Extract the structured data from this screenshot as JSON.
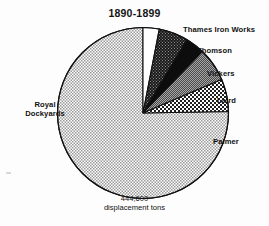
{
  "chart_data": {
    "type": "pie",
    "title": "1890-1899",
    "xlabel": "",
    "ylabel": "",
    "total_label_value": "444,600",
    "total_label_units": "displacement tons",
    "units": "displacement tons",
    "total": 444600,
    "legend_position": "outside-labels",
    "grid": false,
    "categories": [
      "Thames Iron Works",
      "Thomson",
      "Vickers",
      "Laird",
      "Palmer",
      "Royal Dockyards"
    ],
    "values": [
      3.0,
      5.5,
      3.5,
      6.5,
      6.0,
      75.5
    ],
    "value_unit": "percent",
    "slices": [
      {
        "label": "Thames Iron Works",
        "percent": 3.0,
        "start_angle": 0,
        "end_angle": 11,
        "fill": "white",
        "fill_color": "#ffffff"
      },
      {
        "label": "Thomson",
        "percent": 5.5,
        "start_angle": 11,
        "end_angle": 31,
        "fill": "dark-hatch",
        "fill_color": "#2b2b2b"
      },
      {
        "label": "Vickers",
        "percent": 3.5,
        "start_angle": 31,
        "end_angle": 44,
        "fill": "solid-black",
        "fill_color": "#0d0d0d"
      },
      {
        "label": "Laird",
        "percent": 6.5,
        "start_angle": 44,
        "end_angle": 67,
        "fill": "dark-gray",
        "fill_color": "#6e6e6e"
      },
      {
        "label": "Palmer",
        "percent": 6.0,
        "start_angle": 67,
        "end_angle": 89,
        "fill": "checkerboard",
        "fill_color": "#8a8a8a"
      },
      {
        "label": "Royal Dockyards",
        "percent": 75.5,
        "start_angle": 89,
        "end_angle": 360,
        "fill": "light-stipple",
        "fill_color": "#c9c9c9"
      }
    ]
  },
  "labels": {
    "thames": "Thames Iron Works",
    "thomson": "Thomson",
    "vickers": "Vickers",
    "laird": "Laird",
    "palmer": "Palmer",
    "royal_line1": "Royal",
    "royal_line2": "Dockyards"
  },
  "caption": {
    "value": "444,600",
    "units": "displacement tons"
  }
}
